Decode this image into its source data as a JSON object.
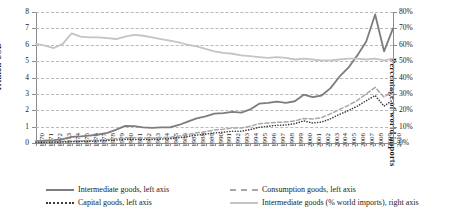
{
  "chart_data": {
    "type": "line",
    "title": "",
    "xlabel": "",
    "ylabel": "Trillion USD",
    "y2label": "Percentage of world imports",
    "ylim": [
      0,
      8
    ],
    "y2lim": [
      0,
      80
    ],
    "grid": true,
    "legend_position": "bottom",
    "y_ticks": [
      "0",
      "1",
      "2",
      "3",
      "4",
      "5",
      "6",
      "7",
      "8"
    ],
    "y2_ticks": [
      "0%",
      "10%",
      "20%",
      "30%",
      "40%",
      "50%",
      "60%",
      "70%",
      "80%"
    ],
    "categories": [
      "1970",
      "1971",
      "1972",
      "1973",
      "1974",
      "1975",
      "1976",
      "1977",
      "1978",
      "1979",
      "1980",
      "1981",
      "1982",
      "1983",
      "1984",
      "1985",
      "1986",
      "1987",
      "1988",
      "1989",
      "1990",
      "1991",
      "1992",
      "1993",
      "1994",
      "1995",
      "1996",
      "1997",
      "1998",
      "1999",
      "2000",
      "2001",
      "2002",
      "2003",
      "2004",
      "2005",
      "2006",
      "2007",
      "2008",
      "2009",
      "2010"
    ],
    "series": [
      {
        "name": "Intermediate goods, left axis",
        "axis": "left",
        "style": "solid",
        "color": "#7d7d7d",
        "values": [
          0.12,
          0.14,
          0.17,
          0.24,
          0.38,
          0.4,
          0.45,
          0.52,
          0.62,
          0.82,
          1.05,
          1.03,
          0.95,
          0.92,
          0.95,
          0.95,
          1.1,
          1.3,
          1.5,
          1.62,
          1.8,
          1.82,
          1.9,
          1.86,
          2.05,
          2.4,
          2.45,
          2.52,
          2.45,
          2.55,
          2.95,
          2.8,
          2.9,
          3.35,
          4.05,
          4.6,
          5.35,
          6.2,
          7.85,
          5.6,
          7.0
        ]
      },
      {
        "name": "Consumption goods, left axis",
        "axis": "left",
        "style": "dashed",
        "color": "#a8a8a8",
        "values": [
          0.05,
          0.06,
          0.07,
          0.09,
          0.12,
          0.13,
          0.15,
          0.18,
          0.22,
          0.27,
          0.32,
          0.32,
          0.3,
          0.3,
          0.33,
          0.35,
          0.42,
          0.52,
          0.62,
          0.68,
          0.8,
          0.84,
          0.92,
          0.92,
          1.02,
          1.18,
          1.22,
          1.26,
          1.28,
          1.35,
          1.5,
          1.46,
          1.55,
          1.78,
          2.05,
          2.3,
          2.6,
          3.0,
          3.4,
          2.8,
          3.2
        ]
      },
      {
        "name": "Capital goods, left axis",
        "axis": "left",
        "style": "dotted",
        "color": "#3a3a3a",
        "values": [
          0.03,
          0.04,
          0.05,
          0.06,
          0.08,
          0.09,
          0.1,
          0.12,
          0.15,
          0.18,
          0.22,
          0.22,
          0.21,
          0.21,
          0.24,
          0.26,
          0.32,
          0.4,
          0.48,
          0.54,
          0.62,
          0.66,
          0.72,
          0.72,
          0.82,
          0.96,
          1.02,
          1.08,
          1.1,
          1.18,
          1.35,
          1.22,
          1.28,
          1.48,
          1.75,
          1.98,
          2.25,
          2.58,
          2.9,
          2.25,
          2.65
        ]
      },
      {
        "name": "Intermediate goods (% world imports), right axis",
        "axis": "right",
        "style": "solid-light",
        "color": "#c4c4c4",
        "values": [
          60.5,
          59.5,
          58.0,
          60.5,
          67.0,
          65.0,
          64.5,
          64.5,
          64.0,
          63.5,
          65.0,
          66.0,
          65.5,
          64.5,
          63.5,
          62.5,
          61.5,
          60.0,
          59.0,
          57.5,
          56.0,
          55.0,
          54.5,
          53.5,
          53.0,
          52.5,
          52.0,
          52.5,
          52.0,
          51.0,
          51.5,
          51.0,
          50.5,
          50.5,
          51.0,
          51.5,
          51.5,
          51.0,
          51.5,
          50.5,
          51.5
        ]
      }
    ]
  },
  "legend": {
    "items": [
      {
        "label": "Intermediate goods, left axis",
        "key": "k-solid"
      },
      {
        "label": "Capital goods, left axis",
        "key": "k-dotted"
      },
      {
        "label": "Consumption goods, left axis",
        "key": "k-dashed"
      },
      {
        "label": "Intermediate goods (% world imports), right axis",
        "key": "k-light"
      }
    ]
  }
}
